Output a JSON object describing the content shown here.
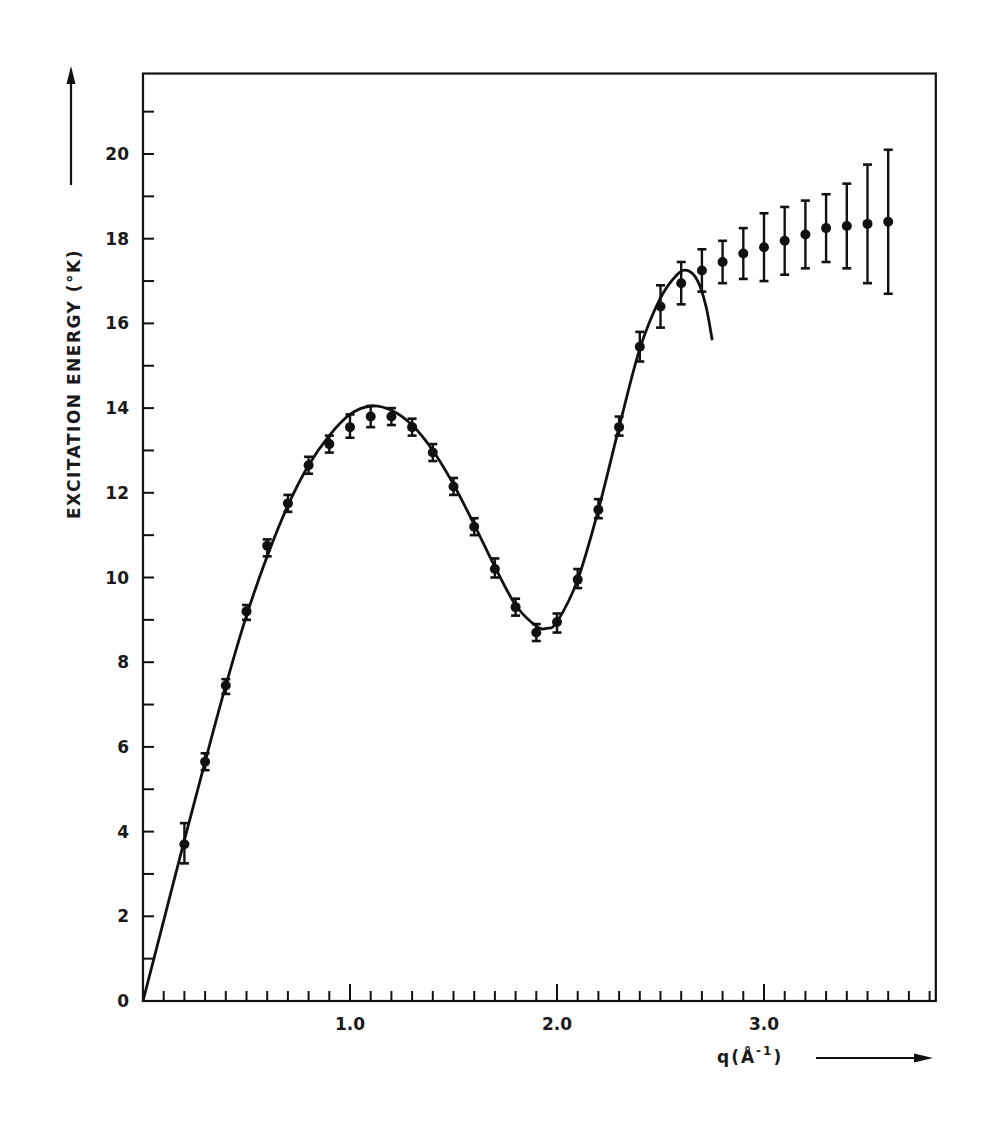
{
  "chart_data": {
    "type": "scatter",
    "title": "",
    "xlabel": "q(Å⁻¹)",
    "ylabel": "EXCITATION ENERGY (°K)",
    "xlim": [
      0,
      3.83
    ],
    "ylim": [
      0,
      21.9
    ],
    "x_ticks": [
      {
        "value": 1.0,
        "label": "1.0"
      },
      {
        "value": 2.0,
        "label": "2.0"
      },
      {
        "value": 3.0,
        "label": "3.0"
      }
    ],
    "x_minor_step": 0.1,
    "y_ticks": [
      {
        "value": 0,
        "label": "0"
      },
      {
        "value": 2,
        "label": "2"
      },
      {
        "value": 4,
        "label": "4"
      },
      {
        "value": 6,
        "label": "6"
      },
      {
        "value": 8,
        "label": "8"
      },
      {
        "value": 10,
        "label": "10"
      },
      {
        "value": 12,
        "label": "12"
      },
      {
        "value": 14,
        "label": "14"
      },
      {
        "value": 16,
        "label": "16"
      },
      {
        "value": 18,
        "label": "18"
      },
      {
        "value": 20,
        "label": "20"
      }
    ],
    "y_minor_step": 1,
    "grid": false,
    "legend": null,
    "series": [
      {
        "name": "measured excitation energy",
        "kind": "points_with_error_bars",
        "points": [
          {
            "q": 0.2,
            "E": 3.7,
            "lo": 3.25,
            "hi": 4.2
          },
          {
            "q": 0.3,
            "E": 5.65,
            "lo": 5.45,
            "hi": 5.85
          },
          {
            "q": 0.4,
            "E": 7.45,
            "lo": 7.25,
            "hi": 7.6
          },
          {
            "q": 0.5,
            "E": 9.2,
            "lo": 9.0,
            "hi": 9.35
          },
          {
            "q": 0.6,
            "E": 10.75,
            "lo": 10.5,
            "hi": 10.9
          },
          {
            "q": 0.7,
            "E": 11.75,
            "lo": 11.55,
            "hi": 11.95
          },
          {
            "q": 0.8,
            "E": 12.65,
            "lo": 12.45,
            "hi": 12.85
          },
          {
            "q": 0.9,
            "E": 13.15,
            "lo": 12.95,
            "hi": 13.35
          },
          {
            "q": 1.0,
            "E": 13.55,
            "lo": 13.3,
            "hi": 13.85
          },
          {
            "q": 1.1,
            "E": 13.8,
            "lo": 13.55,
            "hi": 14.05
          },
          {
            "q": 1.2,
            "E": 13.8,
            "lo": 13.6,
            "hi": 14.0
          },
          {
            "q": 1.3,
            "E": 13.55,
            "lo": 13.35,
            "hi": 13.75
          },
          {
            "q": 1.4,
            "E": 12.95,
            "lo": 12.75,
            "hi": 13.15
          },
          {
            "q": 1.5,
            "E": 12.15,
            "lo": 11.95,
            "hi": 12.35
          },
          {
            "q": 1.6,
            "E": 11.2,
            "lo": 11.0,
            "hi": 11.4
          },
          {
            "q": 1.7,
            "E": 10.2,
            "lo": 10.0,
            "hi": 10.45
          },
          {
            "q": 1.8,
            "E": 9.3,
            "lo": 9.1,
            "hi": 9.5
          },
          {
            "q": 1.9,
            "E": 8.7,
            "lo": 8.5,
            "hi": 8.9
          },
          {
            "q": 2.0,
            "E": 8.95,
            "lo": 8.7,
            "hi": 9.15
          },
          {
            "q": 2.1,
            "E": 9.95,
            "lo": 9.75,
            "hi": 10.2
          },
          {
            "q": 2.2,
            "E": 11.6,
            "lo": 11.4,
            "hi": 11.85
          },
          {
            "q": 2.3,
            "E": 13.55,
            "lo": 13.35,
            "hi": 13.8
          },
          {
            "q": 2.4,
            "E": 15.45,
            "lo": 15.1,
            "hi": 15.8
          },
          {
            "q": 2.5,
            "E": 16.4,
            "lo": 15.9,
            "hi": 16.9
          },
          {
            "q": 2.6,
            "E": 16.95,
            "lo": 16.45,
            "hi": 17.45
          },
          {
            "q": 2.7,
            "E": 17.25,
            "lo": 16.75,
            "hi": 17.75
          },
          {
            "q": 2.8,
            "E": 17.45,
            "lo": 16.95,
            "hi": 17.95
          },
          {
            "q": 2.9,
            "E": 17.65,
            "lo": 17.05,
            "hi": 18.25
          },
          {
            "q": 3.0,
            "E": 17.8,
            "lo": 17.0,
            "hi": 18.6
          },
          {
            "q": 3.1,
            "E": 17.95,
            "lo": 17.15,
            "hi": 18.75
          },
          {
            "q": 3.2,
            "E": 18.1,
            "lo": 17.3,
            "hi": 18.9
          },
          {
            "q": 3.3,
            "E": 18.25,
            "lo": 17.45,
            "hi": 19.05
          },
          {
            "q": 3.4,
            "E": 18.3,
            "lo": 17.3,
            "hi": 19.3
          },
          {
            "q": 3.5,
            "E": 18.35,
            "lo": 16.95,
            "hi": 19.75
          },
          {
            "q": 3.6,
            "E": 18.4,
            "lo": 16.7,
            "hi": 20.1
          }
        ]
      },
      {
        "name": "dispersion curve fit",
        "kind": "line",
        "points": [
          {
            "q": 0.0,
            "E": 0.0
          },
          {
            "q": 0.1,
            "E": 1.9
          },
          {
            "q": 0.2,
            "E": 3.8
          },
          {
            "q": 0.3,
            "E": 5.65
          },
          {
            "q": 0.4,
            "E": 7.45
          },
          {
            "q": 0.5,
            "E": 9.1
          },
          {
            "q": 0.6,
            "E": 10.5
          },
          {
            "q": 0.7,
            "E": 11.7
          },
          {
            "q": 0.8,
            "E": 12.65
          },
          {
            "q": 0.9,
            "E": 13.35
          },
          {
            "q": 1.0,
            "E": 13.85
          },
          {
            "q": 1.1,
            "E": 14.05
          },
          {
            "q": 1.2,
            "E": 13.95
          },
          {
            "q": 1.3,
            "E": 13.6
          },
          {
            "q": 1.4,
            "E": 13.0
          },
          {
            "q": 1.5,
            "E": 12.2
          },
          {
            "q": 1.6,
            "E": 11.25
          },
          {
            "q": 1.7,
            "E": 10.25
          },
          {
            "q": 1.8,
            "E": 9.35
          },
          {
            "q": 1.9,
            "E": 8.85
          },
          {
            "q": 1.95,
            "E": 8.8
          },
          {
            "q": 2.0,
            "E": 8.95
          },
          {
            "q": 2.1,
            "E": 9.95
          },
          {
            "q": 2.2,
            "E": 11.6
          },
          {
            "q": 2.3,
            "E": 13.55
          },
          {
            "q": 2.4,
            "E": 15.4
          },
          {
            "q": 2.5,
            "E": 16.6
          },
          {
            "q": 2.58,
            "E": 17.15
          },
          {
            "q": 2.63,
            "E": 17.25
          },
          {
            "q": 2.68,
            "E": 17.0
          },
          {
            "q": 2.72,
            "E": 16.4
          },
          {
            "q": 2.75,
            "E": 15.6
          }
        ]
      }
    ]
  },
  "labels": {
    "y_axis_title": "EXCITATION ENERGY (°K)",
    "x_axis_title_base": "q(Å",
    "x_axis_title_sup": "-1",
    "x_axis_title_close": ")"
  }
}
